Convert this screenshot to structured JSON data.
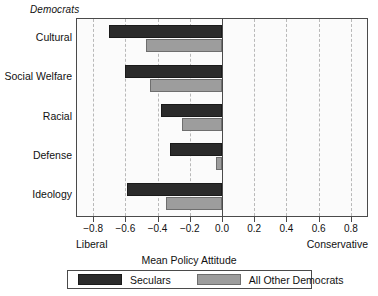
{
  "group_title": "Democrats",
  "axis": {
    "title": "Mean Policy Attitude",
    "left_anchor": "Liberal",
    "right_anchor": "Conservative",
    "tick_labels": [
      "−0.8",
      "−0.6",
      "−0.4",
      "−0.2",
      "0.0",
      "0.2",
      "0.4",
      "0.6",
      "0.8"
    ]
  },
  "legend": {
    "items": [
      {
        "label": "Seculars",
        "color": "#2b2b2b"
      },
      {
        "label": "All Other Democrats",
        "color": "#9d9d9d"
      }
    ]
  },
  "categories": [
    "Cultural",
    "Social Welfare",
    "Racial",
    "Defense",
    "Ideology"
  ],
  "chart_data": {
    "type": "bar",
    "orientation": "horizontal",
    "title": "Democrats",
    "xlabel": "Mean Policy Attitude",
    "ylabel": "",
    "xlim": [
      -0.9,
      0.9
    ],
    "xticks": [
      -0.8,
      -0.6,
      -0.4,
      -0.2,
      0.0,
      0.2,
      0.4,
      0.6,
      0.8
    ],
    "grid": true,
    "legend_position": "bottom",
    "x_axis_left_anchor": "Liberal",
    "x_axis_right_anchor": "Conservative",
    "categories": [
      "Cultural",
      "Social Welfare",
      "Racial",
      "Defense",
      "Ideology"
    ],
    "series": [
      {
        "name": "Seculars",
        "color": "#2b2b2b",
        "values": [
          -0.7,
          -0.6,
          -0.38,
          -0.32,
          -0.59
        ]
      },
      {
        "name": "All Other Democrats",
        "color": "#9d9d9d",
        "values": [
          -0.47,
          -0.45,
          -0.25,
          -0.04,
          -0.35
        ]
      }
    ]
  }
}
